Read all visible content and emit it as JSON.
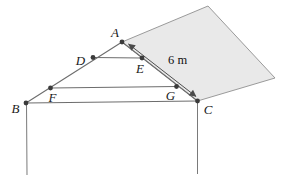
{
  "figure": {
    "point_labels": {
      "A": "A",
      "B": "B",
      "C": "C",
      "D": "D",
      "E": "E",
      "F": "F",
      "G": "G"
    },
    "measurement_label": "6 m",
    "colors": {
      "background": "#ffffff",
      "panel_fill": "#e9e9e9",
      "panel_edge": "#909090",
      "line": "#6d6d6d",
      "arrow": "#4f4f4f",
      "dot": "#3b3b3b",
      "text": "#1a1a1a"
    }
  }
}
